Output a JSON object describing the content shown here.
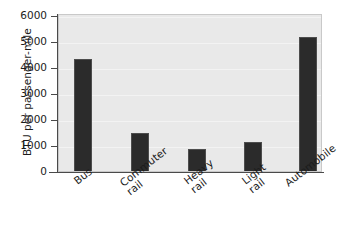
{
  "chart_data": {
    "type": "bar",
    "title": "",
    "subtitle": "",
    "xlabel": "",
    "ylabel": "BTU per passenger-mile",
    "categories": [
      "Bus",
      "Commuter rail",
      "Heavy rail",
      "Light rail",
      "Automobile"
    ],
    "values": [
      4400,
      1550,
      930,
      1180,
      5250
    ],
    "ylim": [
      0,
      6000
    ],
    "ytick_labels": [
      "6000",
      "5000",
      "4000",
      "3000",
      "2000",
      "1000",
      "0"
    ],
    "ytick_values": [
      6000,
      5000,
      4000,
      3000,
      2000,
      1000,
      0
    ],
    "grid": true,
    "legend": false,
    "legend_position": "none",
    "bar_color": "#2b2b2b",
    "plot_background": "#e9e9e9",
    "figure_background": "#ffffff",
    "axis_color": "#4a4a4a",
    "gridline_color": "#f3f3f3",
    "text_color": "#1c1c1c",
    "xtick_label_rotation": -38
  },
  "x_labels": [
    {
      "line1": "Bus",
      "line2": ""
    },
    {
      "line1": "Commuter",
      "line2": "rail"
    },
    {
      "line1": "Heavy",
      "line2": "rail"
    },
    {
      "line1": "Light",
      "line2": "rail"
    },
    {
      "line1": "Automobile",
      "line2": ""
    }
  ]
}
